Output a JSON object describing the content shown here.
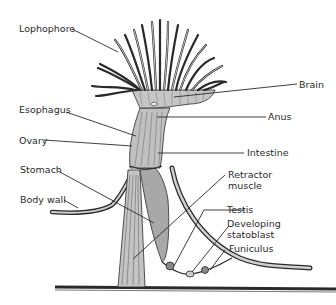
{
  "diagram": {
    "colors": {
      "line": "#2a2a2a",
      "tissue_fill": "#b8b8b8",
      "stomach_fill": "#a8a8a8",
      "background": "#ffffff"
    },
    "labels": {
      "lophophore": "Lophophore",
      "esophagus": "Esophagus",
      "ovary": "Ovary",
      "stomach": "Stomach",
      "body_wall": "Body wall",
      "brain": "Brain",
      "anus": "Anus",
      "intestine": "Intestine",
      "retractor_muscle_1": "Retractor",
      "retractor_muscle_2": "muscle",
      "testis": "Testis",
      "developing_statoblast_1": "Developing",
      "developing_statoblast_2": "statoblast",
      "funiculus": "Funiculus"
    }
  }
}
